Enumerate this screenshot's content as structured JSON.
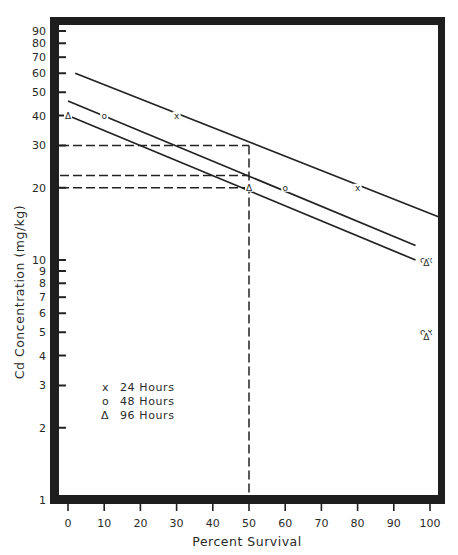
{
  "chart_data": {
    "type": "line",
    "title": "",
    "xlabel": "Percent Survival",
    "ylabel": "Cd Concentration (mg/kg)",
    "x_scale": "linear",
    "y_scale": "log",
    "xlim": [
      -3,
      103
    ],
    "ylim": [
      1,
      100
    ],
    "x_ticks": [
      0,
      10,
      20,
      30,
      40,
      50,
      60,
      70,
      80,
      90,
      100
    ],
    "x_tick_labels": [
      "0",
      "10",
      "20",
      "30",
      "40",
      "50",
      "60",
      "70",
      "80",
      "90",
      "100"
    ],
    "y_ticks": [
      1,
      2,
      3,
      4,
      5,
      6,
      7,
      8,
      9,
      10,
      20,
      30,
      40,
      50,
      60,
      70,
      80,
      90
    ],
    "y_tick_labels": [
      "1",
      "2",
      "3",
      "4",
      "5",
      "6",
      "7",
      "8",
      "9",
      "10",
      "20",
      "30",
      "40",
      "50",
      "60",
      "70",
      "80",
      "90"
    ],
    "grid": false,
    "legend_position": "lower-left inside",
    "series": [
      {
        "name": "24 Hours",
        "marker": "x",
        "fit_line": {
          "x": [
            2,
            103
          ],
          "y": [
            60,
            15
          ]
        },
        "points": [
          {
            "x": 30,
            "y": 40
          },
          {
            "x": 80,
            "y": 20
          },
          {
            "x": 100,
            "y": 10
          },
          {
            "x": 100,
            "y": 5
          }
        ]
      },
      {
        "name": "48 Hours",
        "marker": "o",
        "fit_line": {
          "x": [
            0,
            96
          ],
          "y": [
            46,
            11.5
          ]
        },
        "points": [
          {
            "x": 10,
            "y": 40
          },
          {
            "x": 60,
            "y": 20
          },
          {
            "x": 98,
            "y": 10
          },
          {
            "x": 98,
            "y": 5
          }
        ]
      },
      {
        "name": "96 Hours",
        "marker": "Δ",
        "fit_line": {
          "x": [
            0,
            96
          ],
          "y": [
            40,
            10
          ]
        },
        "points": [
          {
            "x": 0,
            "y": 40
          },
          {
            "x": 50,
            "y": 20
          },
          {
            "x": 99,
            "y": 9.7
          },
          {
            "x": 99,
            "y": 4.8
          }
        ]
      }
    ],
    "annotations": [
      {
        "type": "dashed-vertical",
        "x": 50,
        "label": "LC50 at 50% survival"
      },
      {
        "type": "dashed-horizontal",
        "y": 30,
        "label": "24 h LC50 ≈ 30 mg/kg"
      },
      {
        "type": "dashed-horizontal",
        "y": 22.5,
        "label": "48 h LC50 ≈ 22.5 mg/kg"
      },
      {
        "type": "dashed-horizontal",
        "y": 20,
        "label": "96 h LC50 ≈ 20 mg/kg"
      }
    ]
  },
  "legend": [
    {
      "marker": "x",
      "label": "24 Hours"
    },
    {
      "marker": "o",
      "label": "48 Hours"
    },
    {
      "marker": "Δ",
      "label": "96 Hours"
    }
  ],
  "axes": {
    "xlabel": "Percent Survival",
    "ylabel": "Cd Concentration (mg/kg)"
  },
  "colors": {
    "ink": "#222222",
    "frame": "#1e1e1e",
    "background": "#ffffff"
  }
}
